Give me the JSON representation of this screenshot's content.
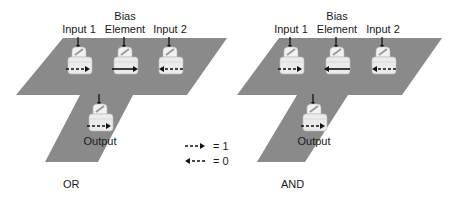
{
  "colors": {
    "surface": "#8a8a8a",
    "block_fill": "#ebebeb",
    "block_top": "#f2f2f2",
    "block_stroke": "#bdbdbd",
    "arrow": "#111111",
    "text": "#1a1a1a"
  },
  "legend": {
    "items": [
      {
        "glyph": "dashed-right-arrow",
        "label": "= 1"
      },
      {
        "glyph": "dashed-left-arrow",
        "label": "= 0"
      }
    ]
  },
  "panels": [
    {
      "caption": "OR",
      "surface": {
        "band": [
          [
            63,
            38
          ],
          [
            227,
            38
          ],
          [
            187,
            95
          ],
          [
            16,
            95
          ]
        ],
        "stem": [
          [
            80,
            95
          ],
          [
            133,
            95
          ],
          [
            98,
            162
          ],
          [
            45,
            162
          ]
        ]
      },
      "caption_pos": [
        63,
        188
      ],
      "elements": [
        {
          "id": "input-1",
          "label": [
            "Input 1"
          ],
          "x": 70,
          "y": 43,
          "arrow": "dashed-right"
        },
        {
          "id": "bias-element",
          "label": [
            "Bias",
            "Element"
          ],
          "x": 116,
          "y": 43,
          "arrow": "solid-right"
        },
        {
          "id": "input-2",
          "label": [
            "Input 2"
          ],
          "x": 161,
          "y": 43,
          "arrow": "dashed-left"
        },
        {
          "id": "output",
          "label": [
            "Output"
          ],
          "x": 91,
          "y": 100,
          "arrow": "dashed-right",
          "label_below": true
        }
      ]
    },
    {
      "caption": "AND",
      "surface": {
        "band": [
          [
            279,
            38
          ],
          [
            442,
            38
          ],
          [
            402,
            95
          ],
          [
            237,
            95
          ]
        ],
        "stem": [
          [
            297,
            95
          ],
          [
            348,
            95
          ],
          [
            305,
            162
          ],
          [
            257,
            162
          ]
        ]
      },
      "caption_pos": [
        281,
        188
      ],
      "elements": [
        {
          "id": "input-1",
          "label": [
            "Input 1"
          ],
          "x": 282,
          "y": 43,
          "arrow": "dashed-right"
        },
        {
          "id": "bias-element",
          "label": [
            "Bias",
            "Element"
          ],
          "x": 328,
          "y": 43,
          "arrow": "solid-left"
        },
        {
          "id": "input-2",
          "label": [
            "Input 2"
          ],
          "x": 374,
          "y": 43,
          "arrow": "dashed-left"
        },
        {
          "id": "output",
          "label": [
            "Output"
          ],
          "x": 305,
          "y": 100,
          "arrow": "dashed-right",
          "label_below": true
        }
      ]
    }
  ],
  "legend_pos": [
    185,
    146
  ]
}
